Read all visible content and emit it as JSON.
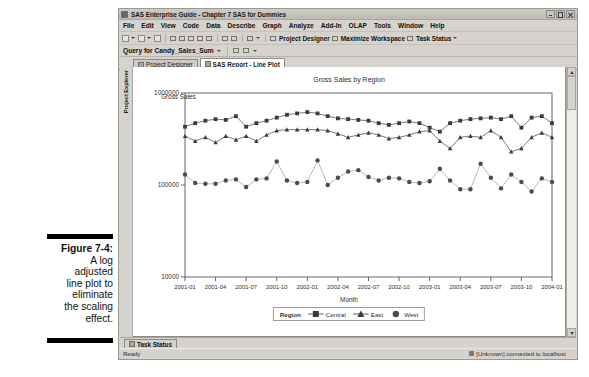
{
  "figure": {
    "label": "Figure 7-4:",
    "lines": [
      "A log",
      "adjusted",
      "line plot to",
      "eliminate",
      "the scaling",
      "effect."
    ]
  },
  "window": {
    "title": "SAS Enterprise Guide - Chapter 7 SAS for Dummies",
    "app_icon": "sas-app-icon",
    "buttons": {
      "minimize": "minimize-button",
      "maximize": "maximize-button",
      "close": "close-button"
    }
  },
  "menu": {
    "items": [
      "File",
      "Edit",
      "View",
      "Code",
      "Data",
      "Describe",
      "Graph",
      "Analyze",
      "Add-In",
      "OLAP",
      "Tools",
      "Window",
      "Help"
    ]
  },
  "toolbar": {
    "project_designer": "Project Designer",
    "maximize_workspace": "Maximize Workspace",
    "task_status": "Task Status"
  },
  "query_bar": {
    "label": "Query for Candy_Sales_Sum"
  },
  "tabs": [
    {
      "label": "Project Designer",
      "active": false
    },
    {
      "label": "SAS Report - Line Plot",
      "active": true
    }
  ],
  "side_panel": {
    "project_explorer": "Project Explorer"
  },
  "bottom_tabs": {
    "task_status": "Task Status"
  },
  "status_bar": {
    "left": "Ready",
    "right": "[Unknown] connected to localhost"
  },
  "chart_data": {
    "type": "line",
    "title": "Gross Sales by Region",
    "xlabel": "Month",
    "ylabel": "Gross Sales",
    "yscale": "log",
    "ylim": [
      10000,
      1000000
    ],
    "ytick_labels": [
      "10000",
      "100000",
      "1000000"
    ],
    "ytick_values": [
      10000,
      100000,
      1000000
    ],
    "xtick_labels": [
      "2001-01",
      "2001-04",
      "2001-07",
      "2001-10",
      "2002-01",
      "2002-04",
      "2002-07",
      "2002-10",
      "2003-01",
      "2003-04",
      "2003-07",
      "2003-10",
      "2004-01"
    ],
    "grid": false,
    "legend_title": "Region",
    "legend_position": "bottom",
    "x": [
      "2001-01",
      "2001-02",
      "2001-03",
      "2001-04",
      "2001-05",
      "2001-06",
      "2001-07",
      "2001-08",
      "2001-09",
      "2001-10",
      "2001-11",
      "2001-12",
      "2002-01",
      "2002-02",
      "2002-03",
      "2002-04",
      "2002-05",
      "2002-06",
      "2002-07",
      "2002-08",
      "2002-09",
      "2002-10",
      "2002-11",
      "2002-12",
      "2003-01",
      "2003-02",
      "2003-03",
      "2003-04",
      "2003-05",
      "2003-06",
      "2003-07",
      "2003-08",
      "2003-09",
      "2003-10",
      "2003-11",
      "2003-12",
      "2004-01"
    ],
    "series": [
      {
        "name": "Central",
        "marker": "square",
        "color": "#3a3a3a",
        "values": [
          430000,
          470000,
          500000,
          520000,
          510000,
          560000,
          430000,
          470000,
          500000,
          540000,
          580000,
          600000,
          620000,
          600000,
          560000,
          530000,
          520000,
          510000,
          500000,
          470000,
          450000,
          470000,
          490000,
          470000,
          420000,
          380000,
          470000,
          500000,
          520000,
          530000,
          540000,
          520000,
          560000,
          420000,
          540000,
          560000,
          470000
        ]
      },
      {
        "name": "East",
        "marker": "triangle",
        "color": "#3a3a3a",
        "values": [
          340000,
          300000,
          330000,
          290000,
          340000,
          310000,
          340000,
          300000,
          350000,
          390000,
          400000,
          400000,
          400000,
          400000,
          390000,
          360000,
          330000,
          350000,
          370000,
          350000,
          320000,
          330000,
          350000,
          380000,
          390000,
          300000,
          250000,
          330000,
          340000,
          330000,
          390000,
          330000,
          230000,
          250000,
          330000,
          370000,
          330000
        ]
      },
      {
        "name": "West",
        "marker": "circle",
        "color": "#4a4a52",
        "values": [
          130000,
          105000,
          103000,
          103000,
          112000,
          115000,
          95000,
          115000,
          118000,
          180000,
          112000,
          105000,
          108000,
          185000,
          100000,
          120000,
          140000,
          145000,
          122000,
          112000,
          120000,
          118000,
          108000,
          105000,
          110000,
          150000,
          112000,
          90000,
          90000,
          170000,
          120000,
          92000,
          130000,
          108000,
          85000,
          118000,
          108000
        ]
      }
    ]
  }
}
